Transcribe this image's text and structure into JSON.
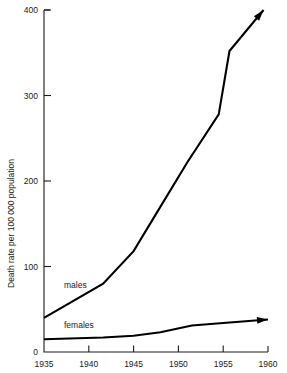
{
  "chart_data": {
    "type": "line",
    "title": "",
    "xlabel": "",
    "ylabel": "Death rate per 100 000 population",
    "xlim": [
      1935,
      1960
    ],
    "ylim": [
      0,
      400
    ],
    "grid": false,
    "legend": "inline-labels",
    "x_ticks": [
      "1935",
      "1940",
      "1945",
      "1950",
      "1955",
      "1960"
    ],
    "x_tick_values": [
      1935,
      1940,
      1945,
      1950,
      1955,
      1960
    ],
    "y_ticks": [
      "0",
      "100",
      "200",
      "300",
      "400"
    ],
    "y_tick_values": [
      0,
      100,
      200,
      300,
      400
    ],
    "series": [
      {
        "name": "males",
        "label": "males",
        "arrow_end": true,
        "arrow_direction": "up-right",
        "x": [
          1935,
          1941.6,
          1945,
          1948,
          1951,
          1954.5,
          1955.7,
          1959.5
        ],
        "values": [
          40,
          80,
          118,
          170,
          222,
          278,
          352,
          400
        ]
      },
      {
        "name": "females",
        "label": "females",
        "arrow_end": true,
        "arrow_direction": "right",
        "x": [
          1935,
          1941.6,
          1945,
          1948,
          1951.5,
          1955,
          1960
        ],
        "values": [
          15,
          17,
          19,
          23,
          31,
          34,
          38
        ]
      }
    ],
    "annotations": [
      {
        "text": "males",
        "x": 1939.5,
        "y": 105
      },
      {
        "text": "females",
        "x": 1939.5,
        "y": 57
      }
    ]
  },
  "axis_title": {
    "y": "Death rate per 100 000 population"
  },
  "colors": {
    "line": "#000000",
    "axis": "#1a1a1a",
    "background": "#ffffff",
    "text": "#1a1a1a"
  }
}
